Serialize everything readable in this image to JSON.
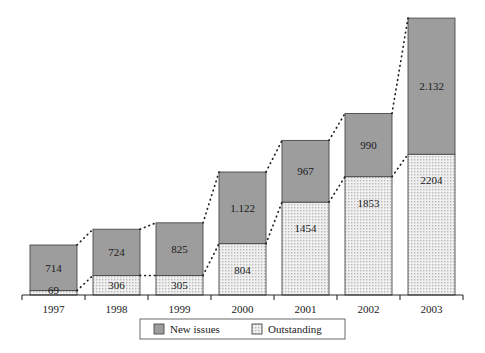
{
  "chart_data": {
    "type": "bar",
    "title": "",
    "subtitle": "",
    "xlabel": "",
    "ylabel": "",
    "stacked": true,
    "grid": false,
    "ylim": [
      0,
      4400
    ],
    "legend_position": "bottom",
    "categories": [
      "1997",
      "1998",
      "1999",
      "2000",
      "2001",
      "2002",
      "2003"
    ],
    "series": [
      {
        "name": "Outstanding",
        "color": "#e9e9e9",
        "pattern": "stipple",
        "values": [
          69,
          306,
          305,
          804,
          1454,
          1853,
          2204
        ],
        "labels": [
          "69",
          "306",
          "305",
          "804",
          "1454",
          "1853",
          "2204"
        ]
      },
      {
        "name": "New issues",
        "color": "#9d9d9d",
        "pattern": "solid",
        "values": [
          714,
          724,
          825,
          1122,
          967,
          990,
          2132
        ],
        "labels": [
          "714",
          "724",
          "825",
          "1.122",
          "967",
          "990",
          "2.132"
        ]
      }
    ],
    "totals": [
      783,
      1030,
      1130,
      1926,
      2421,
      2843,
      4336
    ],
    "connector_lines": [
      {
        "name": "totals-connector",
        "style": "dotted",
        "points": "tops of stacked bars"
      },
      {
        "name": "outstanding-connector",
        "style": "dotted",
        "points": "tops of Outstanding segments"
      }
    ]
  },
  "legend": {
    "items": [
      {
        "label": "New issues",
        "swatch": "solid-gray-swatch"
      },
      {
        "label": "Outstanding",
        "swatch": "stipple-swatch"
      }
    ]
  },
  "colors": {
    "new_issues": "#9d9d9d",
    "outstanding": "#eaeaea",
    "axis": "#2b2b2b",
    "text": "#1a1a1a",
    "border": "#5a5a5a"
  }
}
